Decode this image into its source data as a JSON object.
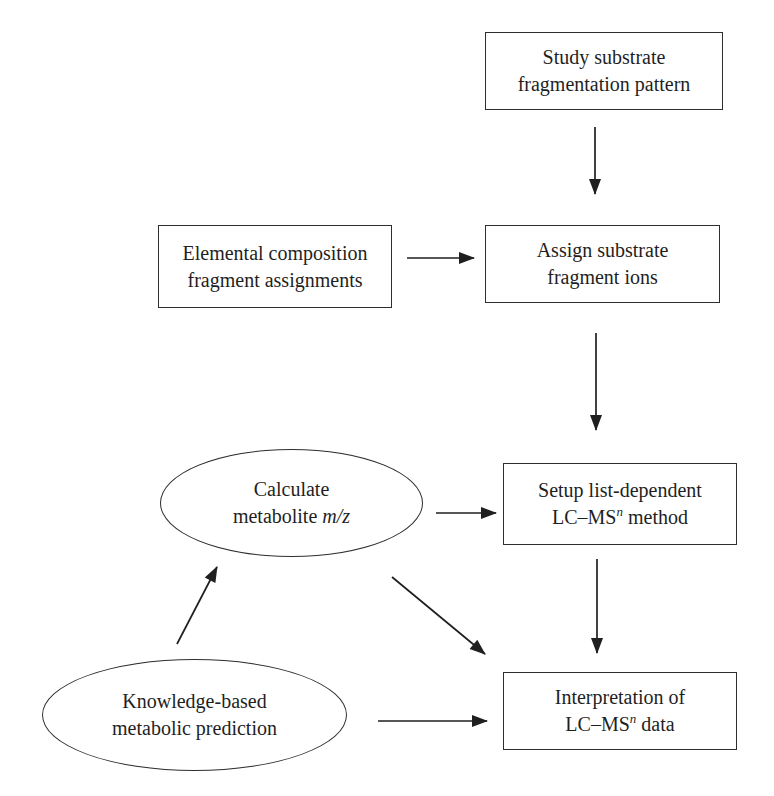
{
  "figure": {
    "type": "flowchart",
    "background": "#ffffff",
    "ink": "#1f1f1f"
  },
  "nodes": {
    "study": {
      "shape": "rect",
      "line1": "Study substrate",
      "line2": "fragmentation pattern"
    },
    "elemental": {
      "shape": "rect",
      "line1": "Elemental composition",
      "line2": "fragment assignments"
    },
    "assign": {
      "shape": "rect",
      "line1": "Assign substrate",
      "line2": "fragment ions"
    },
    "calculate": {
      "shape": "ellipse",
      "line1": "Calculate",
      "line2_pre": "metabolite ",
      "line2_italic": "m/z"
    },
    "setup": {
      "shape": "rect",
      "line1": "Setup list-dependent",
      "line2_pre": "LC–MS",
      "line2_sup": "n",
      "line2_post": " method"
    },
    "knowledge": {
      "shape": "ellipse",
      "line1": "Knowledge-based",
      "line2": "metabolic prediction"
    },
    "interpretation": {
      "shape": "rect",
      "line1": "Interpretation of",
      "line2_pre": "LC–MS",
      "line2_sup": "n",
      "line2_post": " data"
    }
  },
  "edges": [
    {
      "from": "study",
      "to": "assign"
    },
    {
      "from": "elemental",
      "to": "assign"
    },
    {
      "from": "assign",
      "to": "setup"
    },
    {
      "from": "calculate",
      "to": "setup"
    },
    {
      "from": "setup",
      "to": "interpretation"
    },
    {
      "from": "knowledge",
      "to": "calculate"
    },
    {
      "from": "calculate",
      "to": "interpretation"
    },
    {
      "from": "knowledge",
      "to": "interpretation"
    }
  ]
}
